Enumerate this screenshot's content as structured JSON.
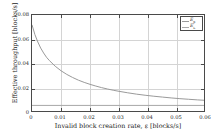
{
  "chart_data": {
    "type": "line",
    "title": "",
    "xlabel": "Invalid block creation rate, ε [blocks/s]",
    "ylabel": "Effective throughput  [blocks/s]",
    "xlim": [
      0,
      0.06
    ],
    "ylim": [
      0,
      0.08
    ],
    "xticks": [
      0,
      0.01,
      0.02,
      0.03,
      0.04,
      0.05,
      0.06
    ],
    "xtick_labels": [
      "0",
      "0.01",
      "0.02",
      "0.03",
      "0.04",
      "0.05",
      "0.06"
    ],
    "yticks": [
      0,
      0.02,
      0.04,
      0.06,
      0.08
    ],
    "ytick_labels": [
      "0",
      "0.02",
      "0.04",
      "0.06",
      "0.08"
    ],
    "grid": true,
    "legend_position": "top-right",
    "series": [
      {
        "name": "E_p",
        "label_base": "E",
        "label_sub": "p",
        "color": "#9a9a9a",
        "x": [
          0,
          0.001,
          0.002,
          0.003,
          0.004,
          0.005,
          0.006,
          0.008,
          0.01,
          0.012,
          0.014,
          0.016,
          0.018,
          0.02,
          0.022,
          0.024,
          0.026,
          0.028,
          0.03,
          0.033,
          0.036,
          0.039,
          0.042,
          0.045,
          0.048,
          0.051,
          0.054,
          0.057,
          0.06
        ],
        "values": [
          0.072,
          0.064,
          0.058,
          0.053,
          0.049,
          0.0455,
          0.0428,
          0.0382,
          0.0345,
          0.0315,
          0.029,
          0.0268,
          0.025,
          0.0234,
          0.022,
          0.0207,
          0.0196,
          0.0186,
          0.0177,
          0.0165,
          0.0154,
          0.0145,
          0.0137,
          0.013,
          0.0123,
          0.0117,
          0.0112,
          0.0107,
          0.0103
        ]
      },
      {
        "name": "E_L",
        "label_base": "E",
        "label_sub": "L",
        "color": "#a8a8a8",
        "x": [
          0,
          0.06
        ],
        "values": [
          0.0062,
          0.0062
        ]
      }
    ],
    "legend": [
      {
        "base": "E",
        "sub": "p"
      },
      {
        "base": "E",
        "sub": "L"
      }
    ]
  }
}
